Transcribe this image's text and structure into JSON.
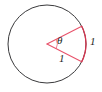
{
  "figure": {
    "type": "geometry-diagram",
    "colors": {
      "circle_stroke": "#3a3a3c",
      "sector_stroke": "#e8536b",
      "arc_stroke": "#d8344f",
      "label_text": "#231f20",
      "background": "#ffffff"
    },
    "circle": {
      "center_x": 47,
      "center_y": 44,
      "radius": 39
    },
    "sector": {
      "start_angle_deg": -27,
      "end_angle_deg": 27,
      "vertex_x": 47,
      "vertex_y": 44,
      "ray_upper_end_x": 82,
      "ray_upper_end_y": 26,
      "ray_lower_end_x": 82,
      "ray_lower_end_y": 62
    },
    "labels": {
      "angle": "θ",
      "radius": "1",
      "arc": "1"
    }
  }
}
